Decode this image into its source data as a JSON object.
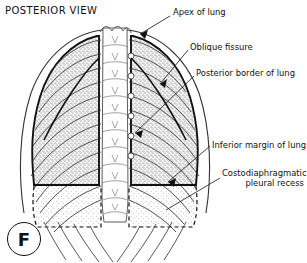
{
  "figure": {
    "view_title": "POSTERIOR VIEW",
    "panel_letter": "F"
  },
  "labels": {
    "apex": "Apex of lung",
    "oblique_fissure": "Oblique fissure",
    "posterior_border": "Posterior border of lung",
    "inferior_margin": "Inferior margin of lung",
    "costodiaphragmatic_recess_line1": "Costodiaphragmatic",
    "costodiaphragmatic_recess_line2": "pleural recess"
  },
  "colors": {
    "ink": "#111111",
    "background": "#ffffff",
    "lung_fill": "#e9e9e9",
    "recess_fill": "#f2f2f2",
    "bone_fill": "#ffffff",
    "leader_line": "#222222"
  },
  "structures": {
    "vertebral_segments": 11,
    "rib_pairs": 12,
    "lung_sides": [
      "left",
      "right"
    ],
    "recess_outline_style": "dashed",
    "inferior_margin_style": "solid-heavy"
  }
}
